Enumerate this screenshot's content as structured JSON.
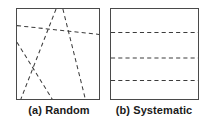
{
  "figure": {
    "background_color": "#ffffff",
    "line_color": "#3c3c3c",
    "border_color": "#4a4a4a"
  },
  "panels": [
    {
      "id": "a",
      "caption": "(a) Random",
      "frame": {
        "x": 16,
        "y": 8,
        "width": 84,
        "height": 92
      }
    },
    {
      "id": "b",
      "caption": "(b) Systematic",
      "frame": {
        "x": 110,
        "y": 8,
        "width": 89,
        "height": 92
      }
    }
  ],
  "chart_data": {
    "type": "line",
    "title": "",
    "subtitle": "",
    "xlabel": "",
    "ylabel": "",
    "grid": false,
    "legend": "none",
    "xlim": [
      0,
      84
    ],
    "ylim": [
      0,
      92
    ],
    "annotations": [
      "(a) Random",
      "(b) Systematic"
    ],
    "panels": [
      {
        "name": "(a) Random",
        "description": "Four randomly oriented dashed transect lines crossing the sample frame at arbitrary angles and positions",
        "line_style": "dashed",
        "line_count": 4,
        "series": [
          {
            "name": "transect-1",
            "x": [
              0,
              84
            ],
            "y": [
              17,
              26
            ]
          },
          {
            "name": "transect-2",
            "x": [
              40,
              4
            ],
            "y": [
              0,
              92
            ]
          },
          {
            "name": "transect-3",
            "x": [
              47,
              70
            ],
            "y": [
              0,
              92
            ]
          },
          {
            "name": "transect-4",
            "x": [
              0,
              36
            ],
            "y": [
              34,
              92
            ]
          }
        ]
      },
      {
        "name": "(b) Systematic",
        "description": "Three evenly spaced parallel dashed transect lines across the sample frame",
        "line_style": "dashed",
        "line_count": 3,
        "spacing": 24,
        "series": [
          {
            "name": "transect-1",
            "x": [
              0,
              89
            ],
            "y": [
              24,
              24
            ]
          },
          {
            "name": "transect-2",
            "x": [
              0,
              89
            ],
            "y": [
              50,
              50
            ]
          },
          {
            "name": "transect-3",
            "x": [
              0,
              89
            ],
            "y": [
              73,
              73
            ]
          }
        ]
      }
    ]
  }
}
